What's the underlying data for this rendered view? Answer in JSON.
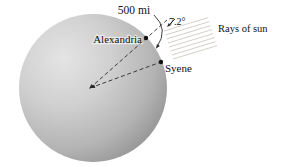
{
  "figure": {
    "labels": {
      "distance": "500 mi",
      "angle": "7.2°",
      "rays": "Rays of sun",
      "city_alexandria": "Alexandria",
      "city_syene": "Syene"
    },
    "colors": {
      "background": "#ffffff",
      "sphere_highlight": "#e4e4e4",
      "sphere_mid": "#d0d0d0",
      "sphere_dark": "#b4b4b4",
      "sphere_edge": "#8d8d8d",
      "ray": "#cfc9c1",
      "line": "#2a2a2a",
      "dot": "#111111",
      "text": "#111111"
    }
  }
}
